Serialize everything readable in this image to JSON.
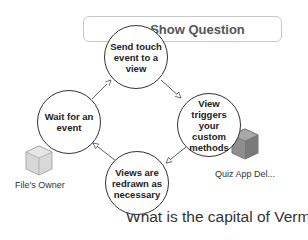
{
  "button": {
    "label": "Show Question"
  },
  "cycle": {
    "nodes": [
      {
        "id": "send",
        "label": "Send touch event to a view"
      },
      {
        "id": "triggers",
        "label": "View triggers your custom methods"
      },
      {
        "id": "redraw",
        "label": "Views are redrawn as necessary"
      },
      {
        "id": "wait",
        "label": "Wait for an event"
      }
    ],
    "edges": [
      {
        "from": "wait",
        "to": "send"
      },
      {
        "from": "send",
        "to": "triggers"
      },
      {
        "from": "triggers",
        "to": "redraw"
      },
      {
        "from": "redraw",
        "to": "wait"
      }
    ]
  },
  "objects": [
    {
      "name": "File's Owner",
      "icon": "cube-icon"
    },
    {
      "name": "Quiz App Del...",
      "icon": "cube-icon"
    }
  ],
  "question_label": "What is the capital of Vermont?",
  "colors": {
    "circle_stroke": "#333333",
    "button_border": "#c8c8c8",
    "cube": "#9a9a9a"
  }
}
